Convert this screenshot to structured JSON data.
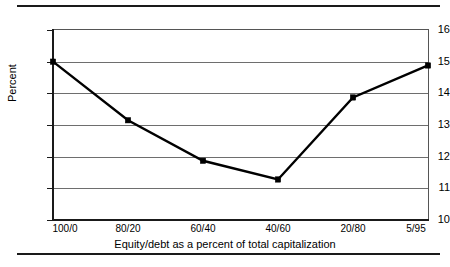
{
  "chart_data": {
    "type": "line",
    "title": "",
    "xlabel": "Equity/debt as a percent of total capitalization",
    "ylabel": "Percent",
    "categories": [
      "100/0",
      "80/20",
      "60/40",
      "40/60",
      "20/80",
      "5/95"
    ],
    "values": [
      15.0,
      13.15,
      11.87,
      11.28,
      13.87,
      14.88
    ],
    "series": [
      {
        "name": "Percent",
        "values": [
          15.0,
          13.15,
          11.87,
          11.28,
          13.87,
          14.88
        ],
        "marker": "filled-square",
        "color": "#000000"
      }
    ],
    "ylim": [
      10,
      16
    ],
    "yticks": [
      10,
      11,
      12,
      13,
      14,
      15,
      16
    ],
    "ytick_labels": [
      "10",
      "11",
      "12",
      "13",
      "14",
      "15",
      "16"
    ],
    "xtick_labels": [
      "100/0",
      "80/20",
      "60/40",
      "40/60",
      "20/80",
      "5/95"
    ],
    "grid": "horizontal",
    "grid_color": "#6e6e6e",
    "legend": "none",
    "frame": true,
    "background": "#ffffff"
  },
  "figure": {
    "top_rule": "",
    "bottom_rule": ""
  }
}
